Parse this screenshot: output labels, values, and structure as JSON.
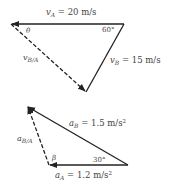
{
  "velocity_diagram": {
    "vA_label": {
      "sym": "v",
      "sub": "A",
      "value": " = 20 m/s"
    },
    "vB_label": {
      "sym": "v",
      "sub": "B",
      "value": " = 15 m/s"
    },
    "vBA_label": {
      "sym": "v",
      "sub": "B/A"
    },
    "angle_theta": "θ",
    "angle_60": "60°"
  },
  "acceleration_diagram": {
    "aB_label": {
      "sym": "a",
      "sub": "B",
      "value": " = 1.5 m/s",
      "sup": "2"
    },
    "aA_label": {
      "sym": "a",
      "sub": "A",
      "value": " = 1.2 m/s",
      "sup": "2"
    },
    "aBA_label": {
      "sym": "a",
      "sub": "B/A"
    },
    "angle_beta": "β",
    "angle_30": "30°"
  },
  "colors": {
    "line": "#222222",
    "text": "#444444"
  }
}
